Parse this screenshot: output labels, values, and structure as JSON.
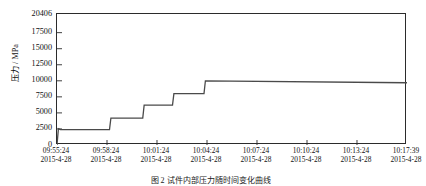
{
  "figure": {
    "caption": "图 2   试件内部压力随时间变化曲线"
  },
  "chart_data": {
    "type": "line",
    "title": "",
    "xlabel": "",
    "ylabel": "压力 / MPa",
    "ylim": [
      0,
      20406
    ],
    "yticks": [
      0,
      2500,
      5000,
      7500,
      10000,
      12500,
      15000,
      17500,
      20406
    ],
    "ytick_labels": [
      "0",
      "2500",
      "5000",
      "7500",
      "10000",
      "12500",
      "15000",
      "17500",
      "20406"
    ],
    "grid": false,
    "legend": null,
    "xtick_labels": [
      {
        "time": "09:55:24",
        "date": "2015-4-28"
      },
      {
        "time": "09:58:24",
        "date": "2015-4-28"
      },
      {
        "time": "10:01:24",
        "date": "2015-4-28"
      },
      {
        "time": "10:04:24",
        "date": "2015-4-28"
      },
      {
        "time": "10:07:24",
        "date": "2015-4-28"
      },
      {
        "time": "10:10:24",
        "date": "2015-4-28"
      },
      {
        "time": "10:13:24",
        "date": "2015-4-28"
      },
      {
        "time": "10:17:39",
        "date": "2015-4-28"
      }
    ],
    "xtick_positions_frac": [
      0,
      0.1429,
      0.2857,
      0.4286,
      0.5714,
      0.7143,
      0.8571,
      1.0
    ],
    "series": [
      {
        "name": "压力",
        "color": "#4a4a4a",
        "x_frac": [
          0.0,
          0.004,
          0.01,
          0.016,
          0.1,
          0.104,
          0.15,
          0.154,
          0.245,
          0.249,
          0.33,
          0.334,
          0.42,
          0.424,
          1.0
        ],
        "values": [
          0,
          2550,
          2400,
          2380,
          2380,
          2400,
          2400,
          4200,
          4200,
          6200,
          6200,
          8000,
          8000,
          10000,
          9700
        ]
      }
    ]
  }
}
